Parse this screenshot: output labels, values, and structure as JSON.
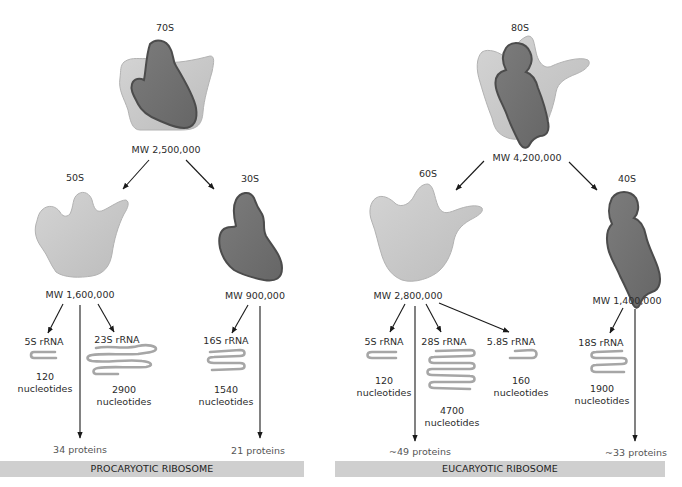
{
  "colors": {
    "large_subunit": "#c4c4c4",
    "large_subunit_edge": "#a9a9a9",
    "small_subunit": "#6e6e6e",
    "small_subunit_edge": "#4a4a4a",
    "rrna": "#a6a6a6",
    "banner": "#cfcfcf",
    "arrow": "#1a1a1a"
  },
  "procaryotic": {
    "banner": "PROCARYOTIC RIBOSOME",
    "whole": {
      "label": "70S",
      "mw": "MW 2,500,000"
    },
    "large": {
      "label": "50S",
      "mw": "MW 1,600,000",
      "rrnas": [
        {
          "name": "5S rRNA",
          "length": "120",
          "unit": "nucleotides"
        },
        {
          "name": "23S rRNA",
          "length": "2900",
          "unit": "nucleotides"
        }
      ],
      "proteins": "34 proteins"
    },
    "small": {
      "label": "30S",
      "mw": "MW 900,000",
      "rrnas": [
        {
          "name": "16S rRNA",
          "length": "1540",
          "unit": "nucleotides"
        }
      ],
      "proteins": "21 proteins"
    }
  },
  "eucaryotic": {
    "banner": "EUCARYOTIC RIBOSOME",
    "whole": {
      "label": "80S",
      "mw": "MW 4,200,000"
    },
    "large": {
      "label": "60S",
      "mw": "MW 2,800,000",
      "rrnas": [
        {
          "name": "5S rRNA",
          "length": "120",
          "unit": "nucleotides"
        },
        {
          "name": "28S rRNA",
          "length": "4700",
          "unit": "nucleotides"
        },
        {
          "name": "5.8S rRNA",
          "length": "160",
          "unit": "nucleotides"
        }
      ],
      "proteins": "~49 proteins"
    },
    "small": {
      "label": "40S",
      "mw": "MW 1,400,000",
      "rrnas": [
        {
          "name": "18S rRNA",
          "length": "1900",
          "unit": "nucleotides"
        }
      ],
      "proteins": "~33 proteins"
    }
  }
}
